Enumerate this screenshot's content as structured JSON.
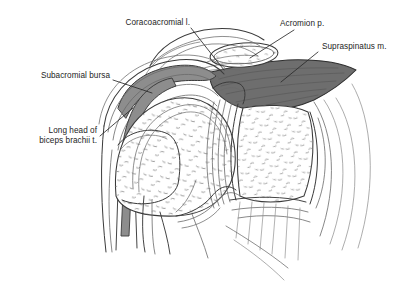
{
  "figure": {
    "type": "anatomical-line-diagram",
    "background_color": "#ffffff",
    "line_color": "#3a3a3a",
    "text_color": "#242424",
    "muscle_fill_color": "#6e6e6e",
    "tendon_fill_color": "#8d8d8d",
    "bone_fill_color": "#ffffff",
    "stipple_color": "#8a8a8a"
  },
  "labels": {
    "coracoacromial_ligament": "Coracoacromial l.",
    "acromion_process": "Acromion p.",
    "supraspinatus_muscle": "Supraspinatus m.",
    "subacromial_bursa": "Subacromial bursa",
    "biceps_line1": "Long head of",
    "biceps_line2": "biceps brachii t."
  }
}
